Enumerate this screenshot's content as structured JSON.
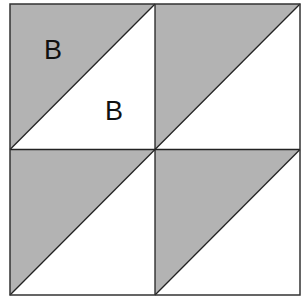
{
  "diagram": {
    "type": "quilt-block",
    "grid": "2x2",
    "colors": {
      "shaded": "#b3b3b3",
      "unshaded": "#ffffff",
      "stroke": "#222222"
    },
    "cells": [
      {
        "id": "top-left",
        "shaded_half": "upper-left",
        "labels": [
          "B",
          "B"
        ]
      },
      {
        "id": "top-right",
        "shaded_half": "upper-left",
        "labels": []
      },
      {
        "id": "bottom-left",
        "shaded_half": "upper-left",
        "labels": []
      },
      {
        "id": "bottom-right",
        "shaded_half": "upper-left",
        "labels": []
      }
    ],
    "labels": {
      "shaded_label": "B",
      "unshaded_label": "B"
    }
  }
}
